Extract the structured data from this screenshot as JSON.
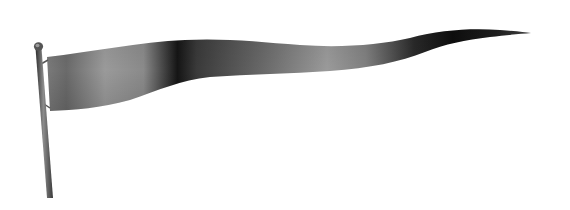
{
  "image": {
    "subject": "pennant flag on pole",
    "background_color": "#ffffff"
  },
  "colors": {
    "pole_dark": "#3a3a3a",
    "pole_light": "#8a8a8a",
    "flag_light": "#9a9a9a",
    "flag_mid": "#6e6e6e",
    "flag_dark": "#111111"
  }
}
